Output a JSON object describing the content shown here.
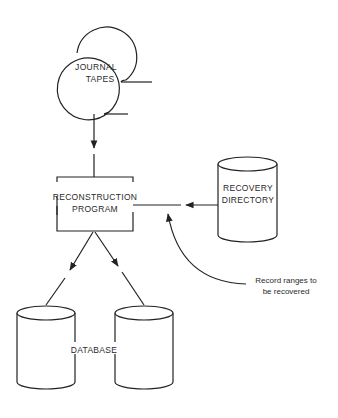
{
  "diagram": {
    "type": "flowchart",
    "nodes": {
      "journal_tapes": {
        "label_line1": "JOURNAL",
        "label_line2": "TAPES",
        "shape": "tape-reels"
      },
      "reconstruction_program": {
        "label_line1": "RECONSTRUCTION",
        "label_line2": "PROGRAM",
        "shape": "rectangle"
      },
      "recovery_directory": {
        "label_line1": "RECOVERY",
        "label_line2": "DIRECTORY",
        "shape": "cylinder"
      },
      "database": {
        "label": "DATABASE",
        "shape": "two-cylinders"
      }
    },
    "annotation": {
      "line1": "Record ranges to",
      "line2": "be recovered"
    },
    "edges": [
      {
        "from": "journal_tapes",
        "to": "reconstruction_program"
      },
      {
        "from": "recovery_directory",
        "to": "reconstruction_program"
      },
      {
        "from": "reconstruction_program",
        "to": "database",
        "target": "left-cylinder"
      },
      {
        "from": "reconstruction_program",
        "to": "database",
        "target": "right-cylinder"
      },
      {
        "from": "annotation",
        "to": "recovery-input-line"
      }
    ],
    "colors": {
      "line": "#222222",
      "text": "#2a2a2a",
      "background": "#ffffff"
    }
  }
}
